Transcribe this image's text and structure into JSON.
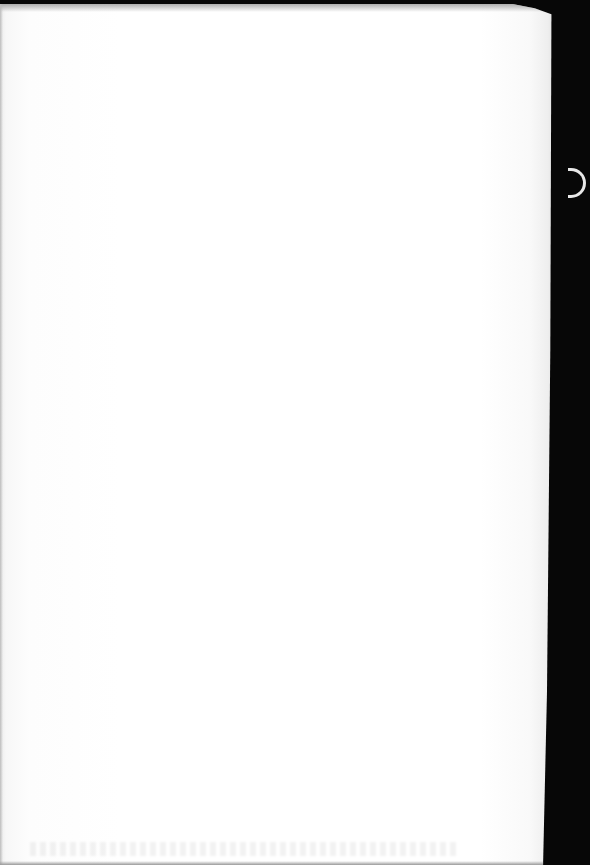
{
  "document": {
    "type": "scanned-page",
    "content": "",
    "is_blank": true
  },
  "colors": {
    "paper": "#ffffff",
    "background": "#050505",
    "clip": "#e8e8e8"
  }
}
